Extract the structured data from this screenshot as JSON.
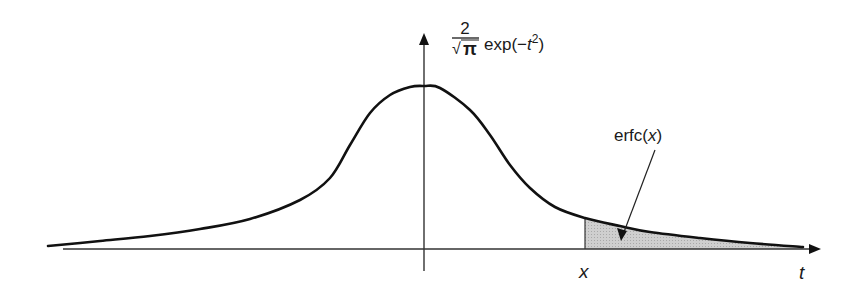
{
  "figure": {
    "y_label": {
      "numerator": "2",
      "denominator_radical": "√",
      "denominator_symbol": "π",
      "function": "exp(−",
      "variable": "t",
      "exponent": "2",
      "close": ")"
    },
    "x_axis_label": "t",
    "cut_label": "x",
    "annotation_label_prefix": "erfc(",
    "annotation_label_var": "x",
    "annotation_label_suffix": ")",
    "colors": {
      "curve": "#111111",
      "axis": "#333333",
      "shade": "#c8c8c8",
      "background": "#ffffff"
    }
  },
  "chart_data": {
    "type": "area",
    "title": "",
    "xlabel": "t",
    "ylabel": "(2/√π) exp(−t²)",
    "curve_pixels": [
      [
        48,
        246
      ],
      [
        100,
        241
      ],
      [
        150,
        236
      ],
      [
        200,
        229
      ],
      [
        250,
        219
      ],
      [
        300,
        200
      ],
      [
        330,
        178
      ],
      [
        350,
        145
      ],
      [
        370,
        113
      ],
      [
        390,
        95
      ],
      [
        410,
        87
      ],
      [
        424,
        86
      ],
      [
        440,
        88
      ],
      [
        470,
        110
      ],
      [
        490,
        135
      ],
      [
        510,
        165
      ],
      [
        530,
        188
      ],
      [
        555,
        207
      ],
      [
        585,
        218
      ],
      [
        620,
        226
      ],
      [
        650,
        232
      ],
      [
        700,
        238
      ],
      [
        750,
        243
      ],
      [
        803,
        247
      ]
    ],
    "shaded_region": {
      "from": "x",
      "to": "+∞",
      "label": "erfc(x)"
    },
    "axes": {
      "origin_px": [
        424,
        249
      ],
      "x_axis_end_px": 821,
      "y_axis_top_px": 33
    },
    "grid": false,
    "legend": null
  }
}
